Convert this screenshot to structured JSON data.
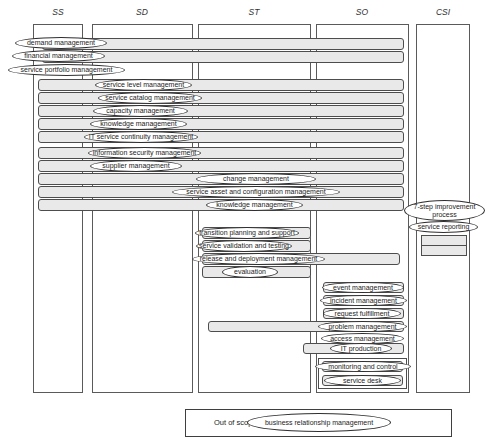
{
  "columns": [
    {
      "label": "SS"
    },
    {
      "label": "SD"
    },
    {
      "label": "ST"
    },
    {
      "label": "SO"
    },
    {
      "label": "CSI"
    }
  ],
  "processes": {
    "demand": "demand management",
    "financial": "financial management",
    "portfolio": "service portfolio management",
    "service_level": "service level management",
    "service_catalog": "service catalog management",
    "capacity": "capacity management",
    "knowledge_sd": "knowledge management",
    "it_continuity": "IT service continuity management",
    "info_security": "information security management",
    "supplier": "supplier management",
    "change": "change management",
    "sacm": "service asset and configuration management",
    "knowledge_st": "knowledge management",
    "transition_planning": "transition planning and support",
    "validation_testing": "service validation and testing",
    "release_deployment": "release and deployment management",
    "evaluation": "evaluation",
    "event": "event management",
    "incident": "incident management",
    "request": "request fulfillment",
    "problem": "problem management",
    "access": "access management",
    "it_production": "IT production",
    "monitoring": "monitoring and control",
    "service_desk": "service desk",
    "seven_step": "7-step improvement process",
    "service_reporting": "service reporting"
  },
  "out_of_scope": {
    "label": "Out of scope:",
    "process": "business relationship management"
  },
  "colors": {
    "background": "#ffffff",
    "bar_fill": "#e9e9e9",
    "bar_border": "#4d4d4d",
    "ellipse_border": "#2f2f2f",
    "column_border": "#5a5a5a",
    "text": "#1f1f1f"
  }
}
